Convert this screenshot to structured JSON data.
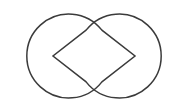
{
  "figure": {
    "title": "Two opposing pac-man shapes",
    "background_color": "#ffffff",
    "stroke_color": "#3b3b3b",
    "stroke_width": 1.5,
    "canvas": {
      "width": 189,
      "height": 111
    },
    "shapes": [
      {
        "id": "left-pacman",
        "name": "Left pac-man (mouth opens right)",
        "type": "circle-sector-cutout",
        "center": {
          "x": 53,
          "y": 56
        },
        "radius": 42,
        "mouth_direction": "right",
        "mouth_angle_degrees": 76,
        "mouth_start_angle_degrees": -38,
        "mouth_end_angle_degrees": 38,
        "vertex": {
          "x": 53,
          "y": 56
        },
        "mouth_upper_corner": {
          "x": 86,
          "y": 30
        },
        "mouth_lower_corner": {
          "x": 86,
          "y": 82
        },
        "path": "M 86.09 30.15 L 53 56 L 86.09 81.85 A 42 42 0 1 0 86.09 30.15 Z"
      },
      {
        "id": "right-pacman",
        "name": "Right pac-man (mouth opens left)",
        "type": "circle-sector-cutout",
        "center": {
          "x": 135,
          "y": 56
        },
        "radius": 42,
        "mouth_direction": "left",
        "mouth_angle_degrees": 76,
        "mouth_start_angle_degrees": 142,
        "mouth_end_angle_degrees": 218,
        "vertex": {
          "x": 135,
          "y": 56
        },
        "mouth_upper_corner": {
          "x": 101.91,
          "y": 30.15
        },
        "mouth_lower_corner": {
          "x": 101.91,
          "y": 81.85
        },
        "path": "M 101.91 81.85 L 135 56 L 101.91 30.15 A 42 42 0 1 0 101.91 81.85 Z"
      }
    ]
  }
}
